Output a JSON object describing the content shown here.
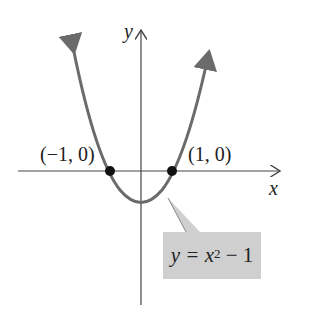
{
  "diagram": {
    "x_axis_label": "x",
    "y_axis_label": "y",
    "points": [
      {
        "label": "(−1, 0)",
        "x": -1,
        "y": 0
      },
      {
        "label": "(1, 0)",
        "x": 1,
        "y": 0
      }
    ],
    "callout": {
      "lhs": "y = x",
      "exponent": "2",
      "rhs": " − 1"
    },
    "colors": {
      "curve": "#6b6b6b",
      "axes": "#444444",
      "points": "#111111",
      "callout_bg": "#cfcfcf"
    }
  }
}
